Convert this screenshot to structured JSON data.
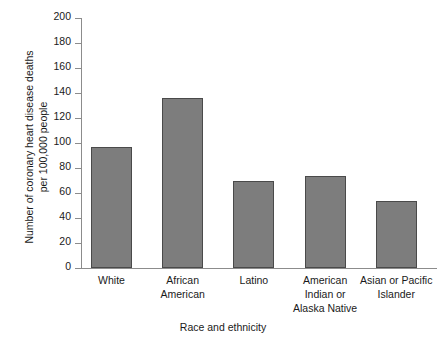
{
  "chart_data": {
    "type": "bar",
    "title": "",
    "xlabel": "Race and ethnicity",
    "ylabel": "Number of coronary heart disease deaths per 100,000 people",
    "ylabel_line1": "Number of coronary heart disease deaths",
    "ylabel_line2": "per 100,000 people",
    "categories": [
      "White",
      "African American",
      "Latino",
      "American Indian or Alaska Native",
      "Asian or Pacific Islander"
    ],
    "category_lines": [
      [
        "White"
      ],
      [
        "African",
        "American"
      ],
      [
        "Latino"
      ],
      [
        "American",
        "Indian or",
        "Alaska Native"
      ],
      [
        "Asian or Pacific",
        "Islander"
      ]
    ],
    "values": [
      97,
      136,
      70,
      74,
      54
    ],
    "ylim": [
      0,
      200
    ],
    "ytick_step": 20,
    "yticks": [
      0,
      20,
      40,
      60,
      80,
      100,
      120,
      140,
      160,
      180,
      200
    ],
    "grid": false,
    "legend": false,
    "bar_color": "#7d7d7d",
    "bar_border_color": "#4a4a4a",
    "axis_color": "#8c8c8c",
    "text_color": "#1a1a1a"
  }
}
